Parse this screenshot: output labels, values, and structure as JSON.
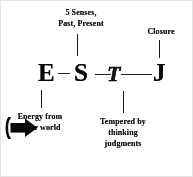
{
  "diagram": {
    "background_color": "#fdfdfd",
    "ink_color": "#121212"
  },
  "letters": [
    {
      "id": "E",
      "text": "E",
      "meaning": "extraversion"
    },
    {
      "id": "S",
      "text": "S",
      "meaning": "sensing"
    },
    {
      "id": "T",
      "text": "T",
      "meaning": "thinking"
    },
    {
      "id": "J",
      "text": "J",
      "meaning": "judging"
    }
  ],
  "labels": {
    "senses": {
      "line1": "5 Senses,",
      "line2": "Past, Present"
    },
    "closure": {
      "line1": "Closure"
    },
    "energy": {
      "line1": "Energy  from",
      "line2": "outer world"
    },
    "tempered": {
      "line1": "Tempered by",
      "line2": "thinking",
      "line3": "judgments"
    }
  },
  "icons": {
    "energy_arrow": "right-arrow-icon"
  }
}
